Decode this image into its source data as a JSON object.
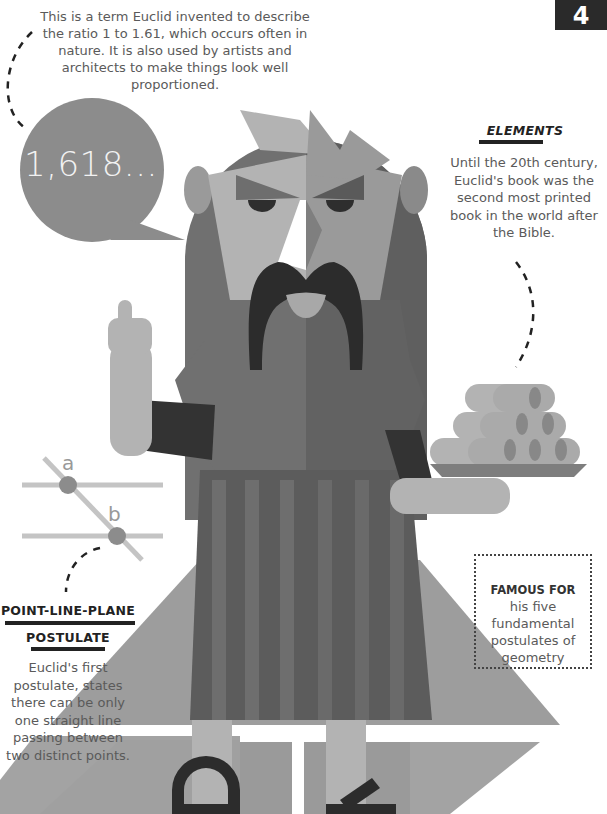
{
  "page": {
    "number": "4"
  },
  "golden_ratio": {
    "description": "This is a term Euclid invented to describe the ratio 1 to 1.61, which occurs often in nature. It is also used by artists and architects to make things look well proportioned.",
    "value": "1,618..."
  },
  "elements": {
    "title": "ELEMENTS",
    "description": "Until the 20th century, Euclid's book was the second most printed book in the world after the Bible."
  },
  "postulate": {
    "title_line1": "POINT-LINE-PLANE",
    "title_line2": "POSTULATE",
    "description": "Euclid's first postulate, states there can be only one straight line passing between two distinct points.",
    "diagram_labels": [
      "a",
      "b"
    ]
  },
  "famous_for": {
    "title": "FAMOUS FOR",
    "description": "his five fundamental postulates of geometry"
  },
  "colors": {
    "dark": "#2a2a2a",
    "hair_dark": "#6e6e6e",
    "hair_light": "#808080",
    "skin_light": "#b5b5b5",
    "skin_mid": "#9c9c9c",
    "robe_dark": "#5c5c5c",
    "robe_light": "#747474",
    "floor": "#9a9a9a",
    "line_gray": "#c4c4c4",
    "text": "#5a5a5a"
  }
}
